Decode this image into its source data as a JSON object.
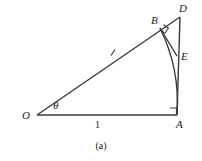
{
  "figure": {
    "caption": "(a)",
    "stroke_color": "#3a3a3a",
    "text_color": "#1a1a1a",
    "background_color": "#ffffff"
  },
  "vertices": [
    {
      "id": "O",
      "label": "O",
      "x": 37,
      "y": 115,
      "label_x": 22,
      "label_y": 110
    },
    {
      "id": "A",
      "label": "A",
      "x": 177,
      "y": 115,
      "label_x": 176,
      "label_y": 119
    },
    {
      "id": "D",
      "label": "D",
      "x": 180,
      "y": 17,
      "label_x": 179,
      "label_y": 3
    },
    {
      "id": "B",
      "label": "B",
      "x": 160,
      "y": 28,
      "label_x": 151,
      "label_y": 15
    },
    {
      "id": "E",
      "label": "E",
      "x": 177,
      "y": 56,
      "label_x": 181,
      "label_y": 51
    }
  ],
  "segments": [
    {
      "name": "base-segment-OA",
      "from": "O",
      "to": "A"
    },
    {
      "name": "ray-segment-OD",
      "from": "O",
      "to": "D"
    },
    {
      "name": "vertical-segment-DA",
      "from": "D",
      "to": "A"
    },
    {
      "name": "segment-BE",
      "from": "B",
      "to": "E"
    }
  ],
  "arcs": [
    {
      "name": "arc-BA",
      "from": "B",
      "to": "A",
      "center": "O"
    }
  ],
  "angle_markers": [
    {
      "name": "angle-theta",
      "at": "O",
      "label": "θ",
      "label_x": 53,
      "label_y": 100
    },
    {
      "name": "right-angle-at-A",
      "at": "A",
      "type": "right-angle"
    },
    {
      "name": "right-angle-at-B",
      "at": "B",
      "type": "right-angle"
    }
  ],
  "length_labels": [
    {
      "name": "length-label-OA",
      "value": "1",
      "x": 95,
      "y": 120
    }
  ],
  "tick_marks": [
    {
      "name": "tick-mark-on-OB",
      "x": 113,
      "y": 52
    }
  ]
}
